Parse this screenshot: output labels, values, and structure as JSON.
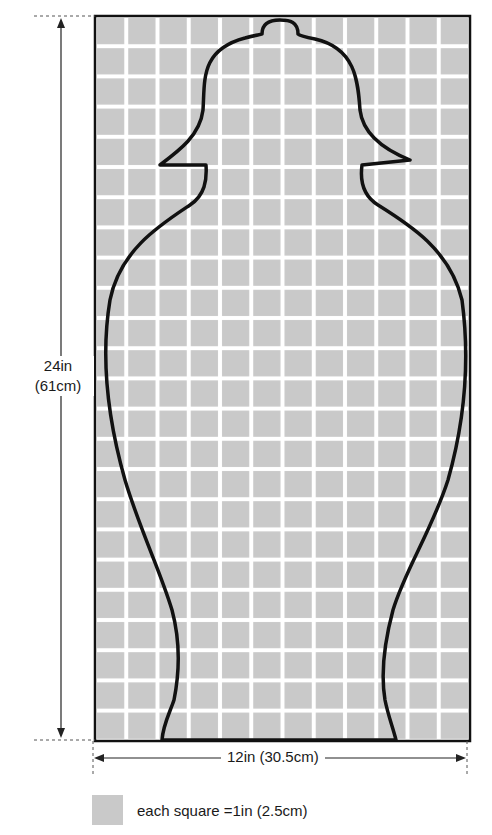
{
  "pattern": {
    "grid_columns": 12,
    "grid_rows": 24,
    "grid_color": "#c9c9c9",
    "grid_line_color": "#ffffff",
    "outline_color": "#111111"
  },
  "dimensions": {
    "height_label_line1": "24in",
    "height_label_line2": "(61cm)",
    "width_label": "12in (30.5cm)"
  },
  "legend": {
    "text": "each square =1in (2.5cm)"
  }
}
